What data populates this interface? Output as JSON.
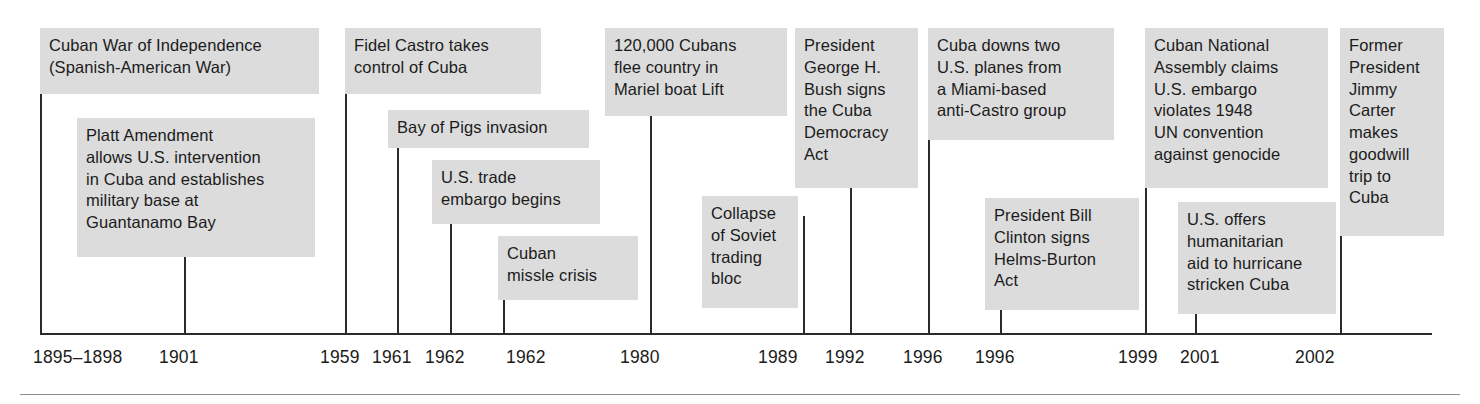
{
  "figure": {
    "type": "timeline",
    "box_fill_color": "#dcdcdc",
    "line_color": "#2b2b2b",
    "text_color": "#1b1b1b",
    "background_color": "#ffffff"
  },
  "axis": {
    "x_start": 40,
    "x_end": 1432,
    "y": 333,
    "tick_count": 14
  },
  "events": [
    {
      "id": "cuban-war-of-independence",
      "date_label": "1895–1898",
      "text": "Cuban War of Independence\n(Spanish-American War)",
      "box": {
        "left": 40,
        "top": 28,
        "width": 279,
        "height": 66
      },
      "stem": {
        "x": 40,
        "top": 94,
        "bottom": 333
      },
      "date_x": 33
    },
    {
      "id": "platt-amendment",
      "date_label": "1901",
      "text": "Platt Amendment\nallows U.S. intervention\nin Cuba and establishes\nmilitary base at\nGuantanamo Bay",
      "box": {
        "left": 77,
        "top": 118,
        "width": 238,
        "height": 139
      },
      "stem": {
        "x": 184,
        "top": 257,
        "bottom": 333
      },
      "date_x": 159
    },
    {
      "id": "fidel-castro-takes-control",
      "date_label": "1959",
      "text": "Fidel Castro takes\ncontrol of Cuba",
      "box": {
        "left": 345,
        "top": 28,
        "width": 196,
        "height": 66
      },
      "stem": {
        "x": 345,
        "top": 94,
        "bottom": 333
      },
      "date_x": 320
    },
    {
      "id": "bay-of-pigs-invasion",
      "date_label": "1961",
      "text": "Bay of Pigs invasion",
      "box": {
        "left": 388,
        "top": 110,
        "width": 201,
        "height": 38
      },
      "stem": {
        "x": 397,
        "top": 148,
        "bottom": 333
      },
      "date_x": 372
    },
    {
      "id": "us-trade-embargo",
      "date_label": "1962",
      "text": "U.S. trade\nembargo begins",
      "box": {
        "left": 432,
        "top": 160,
        "width": 168,
        "height": 64
      },
      "stem": {
        "x": 450,
        "top": 224,
        "bottom": 333
      },
      "date_x": 425
    },
    {
      "id": "cuban-missile-crisis",
      "date_label": "1962",
      "text": "Cuban\nmissle crisis",
      "box": {
        "left": 498,
        "top": 236,
        "width": 140,
        "height": 64
      },
      "stem": {
        "x": 503,
        "top": 300,
        "bottom": 333
      },
      "date_x": 506
    },
    {
      "id": "mariel-boat-lift",
      "date_label": "1980",
      "text": "120,000 Cubans\nflee country in\nMariel boat Lift",
      "box": {
        "left": 605,
        "top": 28,
        "width": 182,
        "height": 88
      },
      "stem": {
        "x": 650,
        "top": 116,
        "bottom": 333
      },
      "date_x": 620
    },
    {
      "id": "collapse-of-soviet-trading-bloc",
      "date_label": "1989",
      "text": "Collapse\nof Soviet\ntrading\nbloc",
      "box": {
        "left": 702,
        "top": 196,
        "width": 96,
        "height": 112
      },
      "stem": {
        "x": 803,
        "top": 216,
        "bottom": 333
      },
      "date_x": 758
    },
    {
      "id": "cuba-democracy-act",
      "date_label": "1992",
      "text": "President\nGeorge H.\nBush signs\nthe Cuba\nDemocracy\nAct",
      "box": {
        "left": 795,
        "top": 28,
        "width": 123,
        "height": 160
      },
      "stem": {
        "x": 850,
        "top": 188,
        "bottom": 333
      },
      "date_x": 825
    },
    {
      "id": "cuba-downs-two-us-planes",
      "date_label": "1996",
      "text": "Cuba downs two\nU.S. planes from\na Miami-based\nanti-Castro group",
      "box": {
        "left": 928,
        "top": 28,
        "width": 186,
        "height": 112
      },
      "stem": {
        "x": 928,
        "top": 140,
        "bottom": 333
      },
      "date_x": 903
    },
    {
      "id": "helms-burton-act",
      "date_label": "1996",
      "text": "President Bill\nClinton signs\nHelms-Burton\nAct",
      "box": {
        "left": 985,
        "top": 198,
        "width": 154,
        "height": 112
      },
      "stem": {
        "x": 1000,
        "top": 310,
        "bottom": 333
      },
      "date_x": 975
    },
    {
      "id": "cuban-national-assembly-claims",
      "date_label": "1999",
      "text": "Cuban National\nAssembly claims\nU.S. embargo\nviolates 1948\nUN convention\nagainst genocide",
      "box": {
        "left": 1145,
        "top": 28,
        "width": 183,
        "height": 160
      },
      "stem": {
        "x": 1145,
        "top": 188,
        "bottom": 333
      },
      "date_x": 1118
    },
    {
      "id": "us-humanitarian-aid",
      "date_label": "2001",
      "text": "U.S. offers\nhumanitarian\naid to hurricane\nstricken Cuba",
      "box": {
        "left": 1178,
        "top": 202,
        "width": 158,
        "height": 112
      },
      "stem": {
        "x": 1195,
        "top": 314,
        "bottom": 333
      },
      "date_x": 1180
    },
    {
      "id": "jimmy-carter-goodwill-trip",
      "date_label": "2002",
      "text": "Former\nPresident\nJimmy\nCarter\nmakes\ngoodwill\ntrip to\nCuba",
      "box": {
        "left": 1340,
        "top": 28,
        "width": 104,
        "height": 208
      },
      "stem": {
        "x": 1340,
        "top": 236,
        "bottom": 333
      },
      "date_x": 1295
    }
  ],
  "page_rule": {
    "left": 20,
    "right": 1460,
    "y": 394
  }
}
